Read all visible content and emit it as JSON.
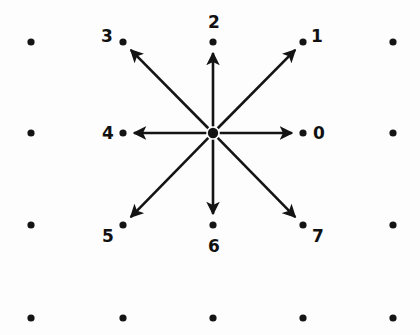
{
  "figure": {
    "background_color": "#fdfdfd",
    "ink_color": "#141414",
    "width": 420,
    "height": 335
  },
  "grid": {
    "columns_x": [
      31,
      123,
      213,
      303,
      393
    ],
    "rows_y": [
      42,
      133,
      225,
      318
    ],
    "dot_radius": 3.6,
    "center_dot_radius": 5.2,
    "center": {
      "x": 213,
      "y": 133
    }
  },
  "directions": [
    {
      "id": "0",
      "label": "0",
      "angle_deg": 0,
      "dot": {
        "x": 303,
        "y": 133
      },
      "label_pos": {
        "x": 313,
        "y": 125
      }
    },
    {
      "id": "1",
      "label": "1",
      "angle_deg": 45,
      "dot": {
        "x": 303,
        "y": 42
      },
      "label_pos": {
        "x": 311,
        "y": 28
      }
    },
    {
      "id": "2",
      "label": "2",
      "angle_deg": 90,
      "dot": {
        "x": 213,
        "y": 42
      },
      "label_pos": {
        "x": 208,
        "y": 14
      }
    },
    {
      "id": "3",
      "label": "3",
      "angle_deg": 135,
      "dot": {
        "x": 123,
        "y": 42
      },
      "label_pos": {
        "x": 101,
        "y": 28
      }
    },
    {
      "id": "4",
      "label": "4",
      "angle_deg": 180,
      "dot": {
        "x": 123,
        "y": 133
      },
      "label_pos": {
        "x": 102,
        "y": 125
      }
    },
    {
      "id": "5",
      "label": "5",
      "angle_deg": 225,
      "dot": {
        "x": 123,
        "y": 225
      },
      "label_pos": {
        "x": 102,
        "y": 228
      }
    },
    {
      "id": "6",
      "label": "6",
      "angle_deg": 270,
      "dot": {
        "x": 213,
        "y": 225
      },
      "label_pos": {
        "x": 208,
        "y": 238
      }
    },
    {
      "id": "7",
      "label": "7",
      "angle_deg": 315,
      "dot": {
        "x": 303,
        "y": 225
      },
      "label_pos": {
        "x": 312,
        "y": 228
      }
    }
  ],
  "plain_dots": [
    {
      "x": 31,
      "y": 42
    },
    {
      "x": 393,
      "y": 42
    },
    {
      "x": 31,
      "y": 133
    },
    {
      "x": 393,
      "y": 133
    },
    {
      "x": 31,
      "y": 225
    },
    {
      "x": 393,
      "y": 225
    },
    {
      "x": 31,
      "y": 318
    },
    {
      "x": 123,
      "y": 318
    },
    {
      "x": 213,
      "y": 318
    },
    {
      "x": 303,
      "y": 318
    },
    {
      "x": 393,
      "y": 318
    }
  ],
  "chart_data": {
    "type": "scatter",
    "xlabel": "",
    "ylabel": "",
    "grid": true,
    "legend": null,
    "categories": [
      "0",
      "1",
      "2",
      "3",
      "4",
      "5",
      "6",
      "7"
    ],
    "series": [
      {
        "name": "direction vectors from center",
        "origin": {
          "x": 213,
          "y": 133
        },
        "points": [
          {
            "label": "0",
            "x": 303,
            "y": 133,
            "dx": 1,
            "dy": 0,
            "angle_deg": 0
          },
          {
            "label": "1",
            "x": 303,
            "y": 42,
            "dx": 1,
            "dy": 1,
            "angle_deg": 45
          },
          {
            "label": "2",
            "x": 213,
            "y": 42,
            "dx": 0,
            "dy": 1,
            "angle_deg": 90
          },
          {
            "label": "3",
            "x": 123,
            "y": 42,
            "dx": -1,
            "dy": 1,
            "angle_deg": 135
          },
          {
            "label": "4",
            "x": 123,
            "y": 133,
            "dx": -1,
            "dy": 0,
            "angle_deg": 180
          },
          {
            "label": "5",
            "x": 123,
            "y": 225,
            "dx": -1,
            "dy": -1,
            "angle_deg": 225
          },
          {
            "label": "6",
            "x": 213,
            "y": 225,
            "dx": 0,
            "dy": -1,
            "angle_deg": 270
          },
          {
            "label": "7",
            "x": 303,
            "y": 225,
            "dx": 1,
            "dy": -1,
            "angle_deg": 315
          }
        ]
      },
      {
        "name": "unlabeled lattice points",
        "points": [
          {
            "x": 31,
            "y": 42
          },
          {
            "x": 393,
            "y": 42
          },
          {
            "x": 31,
            "y": 133
          },
          {
            "x": 393,
            "y": 133
          },
          {
            "x": 31,
            "y": 225
          },
          {
            "x": 393,
            "y": 225
          },
          {
            "x": 31,
            "y": 318
          },
          {
            "x": 123,
            "y": 318
          },
          {
            "x": 213,
            "y": 318
          },
          {
            "x": 303,
            "y": 318
          },
          {
            "x": 393,
            "y": 318
          }
        ]
      }
    ]
  }
}
